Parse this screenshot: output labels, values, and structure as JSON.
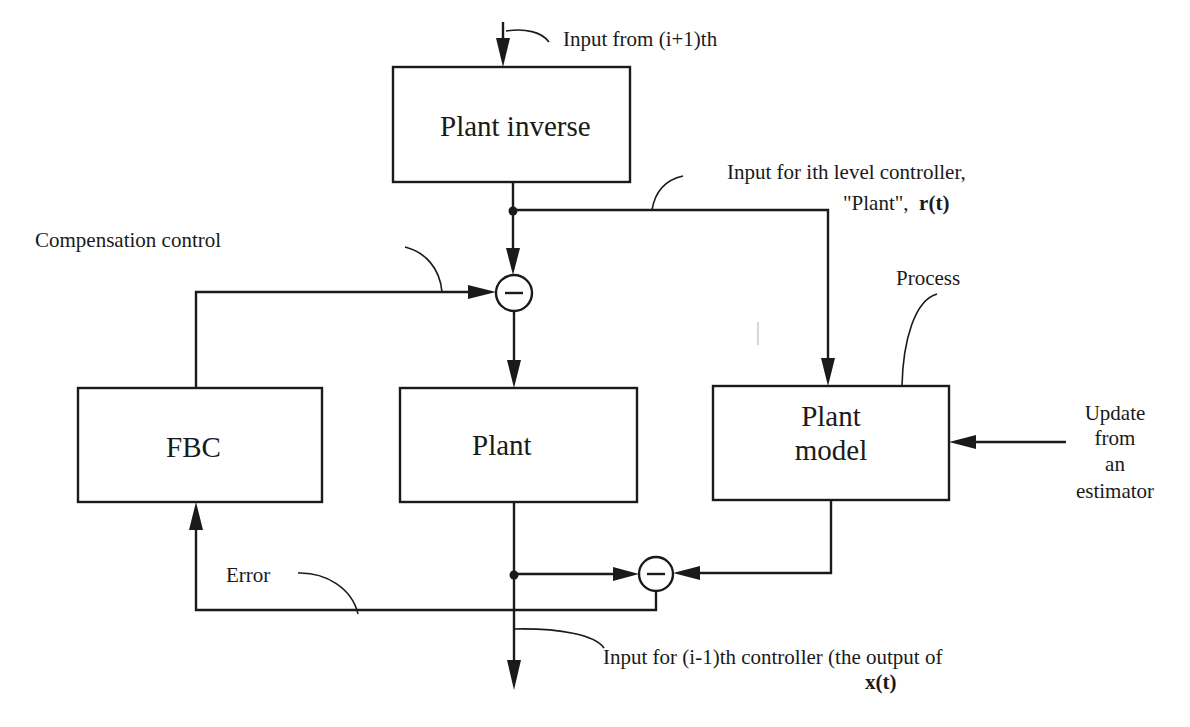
{
  "diagram": {
    "blocks": {
      "plant_inverse": "Plant inverse",
      "fbc": "FBC",
      "plant": "Plant",
      "plant_model_line1": "Plant",
      "plant_model_line2": "model"
    },
    "labels": {
      "input_from_above": "Input from (i+1)th",
      "input_ith_line1": "Input for ith level controller,",
      "input_ith_line2_plain": "\"Plant\",",
      "input_ith_line2_bold": "r(t)",
      "compensation_control": "Compensation control",
      "process": "Process",
      "update_line1": "Update",
      "update_line2": "from",
      "update_line3": "an",
      "update_line4": "estimator",
      "error": "Error",
      "output_line1": "Input for (i-1)th controller (the output of",
      "output_line2_bold": "x(t)"
    },
    "summing_junctions": [
      {
        "id": "compensation-sum",
        "sign": "−"
      },
      {
        "id": "error-sum",
        "sign": "−"
      }
    ],
    "colors": {
      "ink": "#1a1a1a",
      "background": "#ffffff"
    }
  }
}
